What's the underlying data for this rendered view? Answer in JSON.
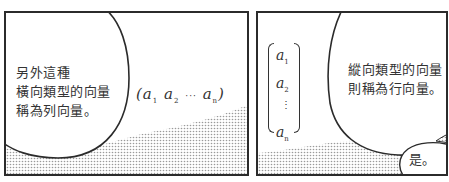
{
  "panels": [
    {
      "id": "panel-1",
      "speech": {
        "lines": [
          "另外這種",
          "橫向類型的向量",
          "稱為列向量。"
        ]
      },
      "row_vector": {
        "open": "(",
        "entries": [
          {
            "base": "a",
            "sub": "1"
          },
          {
            "base": "a",
            "sub": "2"
          },
          {
            "base": "a",
            "sub": "n"
          }
        ],
        "ellipsis": "···",
        "close": ")"
      }
    },
    {
      "id": "panel-2",
      "column_vector": {
        "entries": [
          {
            "base": "a",
            "sub": "1"
          },
          {
            "base": "a",
            "sub": "2"
          },
          {
            "base": "a",
            "sub": "n"
          }
        ],
        "ellipsis": "⋮"
      },
      "speech": {
        "lines": [
          "縱向類型的向量",
          "則稱為行向量。"
        ]
      },
      "reply": {
        "text": "是。"
      }
    }
  ],
  "colors": {
    "ink": "#2b2b2b",
    "screentone": "#b8b8b8",
    "paper": "#ffffff"
  }
}
